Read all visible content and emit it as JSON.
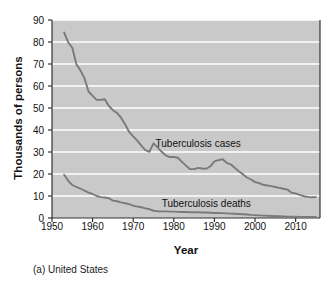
{
  "figure": {
    "caption": "(a) United States",
    "xlabel": "Year",
    "ylabel": "Thousands of persons"
  },
  "colors": {
    "plot_background": "#c9c9c9",
    "gridline": "#ffffff",
    "line": "#7a7a7a",
    "axis": "#333333",
    "text": "#111111"
  },
  "chart_data": {
    "type": "line",
    "title": "",
    "subtitle": "",
    "caption": "(a) United States",
    "xlabel": "Year",
    "ylabel": "Thousands of persons",
    "xlim": [
      1950,
      2016
    ],
    "ylim": [
      0,
      90
    ],
    "xticks": [
      1950,
      1960,
      1970,
      1980,
      1990,
      2000,
      2010
    ],
    "yticks": [
      0,
      10,
      20,
      30,
      40,
      50,
      60,
      70,
      80,
      90
    ],
    "grid": "horizontal",
    "legend": "inline-annotations",
    "annotations": [
      {
        "text": "Tuberculosis cases",
        "x": 1986,
        "y": 33.5
      },
      {
        "text": "Tuberculosis deaths",
        "x": 1988,
        "y": 6.5
      }
    ],
    "series": [
      {
        "name": "Tuberculosis cases",
        "x": [
          1953,
          1954,
          1955,
          1956,
          1957,
          1958,
          1959,
          1960,
          1961,
          1962,
          1963,
          1964,
          1965,
          1966,
          1967,
          1968,
          1969,
          1970,
          1971,
          1972,
          1973,
          1974,
          1975,
          1976,
          1977,
          1978,
          1979,
          1980,
          1981,
          1982,
          1983,
          1984,
          1985,
          1986,
          1987,
          1988,
          1989,
          1990,
          1991,
          1992,
          1993,
          1994,
          1995,
          1996,
          1997,
          1998,
          1999,
          2000,
          2001,
          2002,
          2003,
          2004,
          2005,
          2006,
          2007,
          2008,
          2009,
          2010,
          2011,
          2012,
          2013,
          2014,
          2015
        ],
        "values": [
          84.3,
          79.8,
          77.4,
          69.9,
          67.1,
          63.5,
          57.5,
          55.5,
          53.7,
          53.7,
          54.0,
          50.9,
          49.0,
          47.8,
          45.6,
          42.6,
          39.1,
          37.1,
          35.2,
          32.9,
          30.9,
          30.1,
          33.9,
          32.1,
          30.1,
          28.5,
          27.7,
          27.7,
          27.4,
          25.5,
          23.8,
          22.2,
          22.2,
          22.8,
          22.5,
          22.4,
          23.5,
          25.7,
          26.3,
          26.7,
          25.1,
          24.4,
          22.8,
          21.3,
          19.9,
          18.4,
          17.5,
          16.3,
          15.9,
          15.1,
          14.8,
          14.5,
          14.1,
          13.7,
          13.3,
          12.9,
          11.5,
          11.2,
          10.5,
          9.9,
          9.6,
          9.4,
          9.5
        ]
      },
      {
        "name": "Tuberculosis deaths",
        "x": [
          1953,
          1954,
          1955,
          1956,
          1957,
          1958,
          1959,
          1960,
          1961,
          1962,
          1963,
          1964,
          1965,
          1966,
          1967,
          1968,
          1969,
          1970,
          1971,
          1972,
          1973,
          1974,
          1975,
          1976,
          1977,
          1978,
          1979,
          1980,
          1981,
          1982,
          1983,
          1984,
          1985,
          1986,
          1987,
          1988,
          1989,
          1990,
          1991,
          1992,
          1993,
          1994,
          1995,
          1996,
          1997,
          1998,
          1999,
          2000,
          2001,
          2002,
          2003,
          2004,
          2005,
          2006,
          2007,
          2008,
          2009,
          2010,
          2011,
          2012,
          2013,
          2014,
          2015
        ],
        "values": [
          19.7,
          16.9,
          15.0,
          14.1,
          13.4,
          12.4,
          11.5,
          10.9,
          10.0,
          9.5,
          9.3,
          9.0,
          7.9,
          7.6,
          7.1,
          6.7,
          6.3,
          5.6,
          5.2,
          4.9,
          4.4,
          4.0,
          3.3,
          3.1,
          3.0,
          3.0,
          2.9,
          2.9,
          2.8,
          2.7,
          2.7,
          2.6,
          2.6,
          2.6,
          2.5,
          2.5,
          2.4,
          2.3,
          2.3,
          2.2,
          2.1,
          2.0,
          1.9,
          1.8,
          1.7,
          1.6,
          1.4,
          1.3,
          1.2,
          1.1,
          1.0,
          0.9,
          0.8,
          0.8,
          0.7,
          0.6,
          0.6,
          0.6,
          0.5,
          0.5,
          0.5,
          0.5,
          0.5
        ]
      }
    ]
  },
  "axis_labels": {
    "y": [
      "0",
      "10",
      "20",
      "30",
      "40",
      "50",
      "60",
      "70",
      "80",
      "90"
    ],
    "x": [
      "1950",
      "1960",
      "1970",
      "1980",
      "1990",
      "2000",
      "2010"
    ]
  }
}
